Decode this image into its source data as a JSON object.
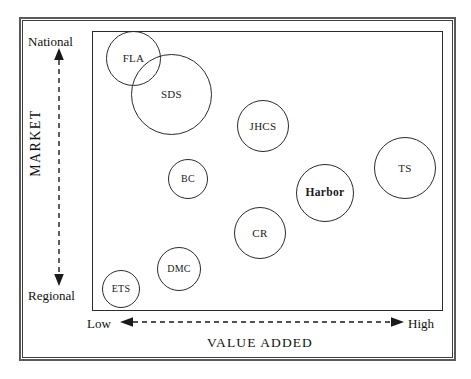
{
  "chart_data": {
    "type": "scatter",
    "title": "",
    "xlabel": "VALUE ADDED",
    "ylabel": "MARKET",
    "x_axis": {
      "label": "VALUE ADDED",
      "low_label": "Low",
      "high_label": "High",
      "style": "dashed double-headed arrow",
      "grid": false
    },
    "y_axis": {
      "label": "MARKET",
      "low_label": "Regional",
      "high_label": "National",
      "style": "dashed double-headed arrow",
      "grid": false
    },
    "legend": null,
    "bubbles": [
      {
        "name": "FLA",
        "label": "FLA",
        "x_qualitative": "Low",
        "y_qualitative": "National",
        "x_pct": 7,
        "y_pct": 96,
        "size_px": 55,
        "bold": false,
        "px": {
          "left": 105,
          "top": 30,
          "diameter": 55
        }
      },
      {
        "name": "SDS",
        "label": "SDS",
        "x_qualitative": "Low",
        "y_qualitative": "National",
        "x_pct": 17,
        "y_pct": 82,
        "size_px": 81,
        "bold": false,
        "px": {
          "left": 130,
          "top": 53,
          "diameter": 81
        }
      },
      {
        "name": "JHCS",
        "label": "JHCS",
        "x_qualitative": "Medium",
        "y_qualitative": "National",
        "x_pct": 48,
        "y_pct": 72,
        "size_px": 52,
        "bold": false,
        "px": {
          "left": 236,
          "top": 99,
          "diameter": 52
        }
      },
      {
        "name": "TS",
        "label": "TS",
        "x_qualitative": "High",
        "y_qualitative": "Medium-High",
        "x_pct": 91,
        "y_pct": 58,
        "size_px": 62,
        "bold": false,
        "px": {
          "left": 373,
          "top": 136,
          "diameter": 62
        }
      },
      {
        "name": "BC",
        "label": "BC",
        "x_qualitative": "Low-Medium",
        "y_qualitative": "Medium",
        "x_pct": 27,
        "y_pct": 54,
        "size_px": 40,
        "bold": false,
        "px": {
          "left": 167,
          "top": 158,
          "diameter": 40
        }
      },
      {
        "name": "Harbor",
        "label": "Harbor",
        "x_qualitative": "Medium-High",
        "y_qualitative": "Medium",
        "x_pct": 70,
        "y_pct": 47,
        "size_px": 58,
        "bold": true,
        "px": {
          "left": 295,
          "top": 163,
          "diameter": 58
        }
      },
      {
        "name": "CR",
        "label": "CR",
        "x_qualitative": "Medium",
        "y_qualitative": "Low-Medium",
        "x_pct": 48,
        "y_pct": 32,
        "size_px": 52,
        "bold": false,
        "px": {
          "left": 233,
          "top": 206,
          "diameter": 52
        }
      },
      {
        "name": "DMC",
        "label": "DMC",
        "x_qualitative": "Low-Medium",
        "y_qualitative": "Regional",
        "x_pct": 23,
        "y_pct": 16,
        "size_px": 44,
        "bold": false,
        "px": {
          "left": 156,
          "top": 246,
          "diameter": 44
        }
      },
      {
        "name": "ETS",
        "label": "ETS",
        "x_qualitative": "Low",
        "y_qualitative": "Regional",
        "x_pct": 5,
        "y_pct": 6,
        "size_px": 38,
        "bold": false,
        "px": {
          "left": 101,
          "top": 269,
          "diameter": 38
        }
      }
    ]
  }
}
